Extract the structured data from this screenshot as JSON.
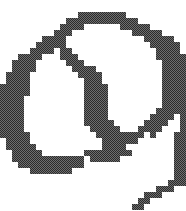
{
  "image": {
    "title": "Pixelated spiral glyph",
    "description": "Low-resolution dithered bitmap of a stylized spiral / comma-like closed hook shape with a tapering stair-stepped tail trailing toward the bottom-right corner",
    "width_px": 186,
    "height_px": 211,
    "background_color": "#ffffff",
    "ink_color": "#3f3f3f",
    "dither_dark": "#2b2b2b",
    "dither_light": "#6f6f6f",
    "rendering": "pixelated",
    "grid": {
      "cell_size_px": 6,
      "cols": 31,
      "rows": 35,
      "offset_x": 0,
      "offset_y": 0
    },
    "fill_style": "checkerboard-halftone-dither",
    "pixels": [
      "...............................",
      "...............................",
      ".............########..........",
      "...........############........",
      "..........####......#####......",
      ".........###..........#####....",
      ".......####.............#####..",
      "......#####..............#####.",
      ".....####.##..............####.",
      "...####...###.............#####",
      "..####.....###.............####",
      "..####......####...........####",
      ".####........####..........####",
      ".####.........###..........####",
      "#####.........####.........####",
      "#####.........####.........####",
      "####..........####.........####",
      "####..........####.........####",
      "####..........####........#####",
      "####..........####.......####.#",
      "####..........#####.....####..#",
      "####...........#####...####...#",
      "#####...........########.#...##",
      ".####............######......##",
      ".#####...........####........##",
      "..#####.......########.......##",
      "..############.#####.........##",
      "...###########...............##",
      ".....#######.................##",
      ".............................##",
      "............................###",
      "..........................###..",
      "........................###....",
      ".......................##......",
      "......................##......."
    ]
  }
}
